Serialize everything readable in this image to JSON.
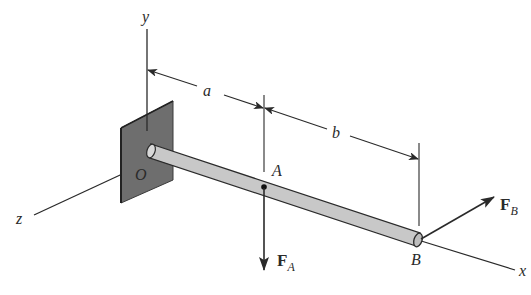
{
  "figure": {
    "type": "cantilever-rod-3d"
  },
  "axes": {
    "x_label": "x",
    "y_label": "y",
    "z_label": "z"
  },
  "points": {
    "origin": "O",
    "a_point": "A",
    "b_point": "B"
  },
  "dimensions": {
    "first": "a",
    "second": "b"
  },
  "forces": {
    "fa_main": "F",
    "fa_sub": "A",
    "fb_main": "F",
    "fb_sub": "B"
  },
  "colors": {
    "line": "#2a2a2a",
    "wall": "#6e6e6e",
    "rod": "#c8c8c8",
    "background": "#ffffff"
  }
}
